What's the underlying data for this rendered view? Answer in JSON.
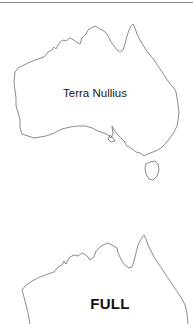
{
  "maps": [
    {
      "region": "Australia",
      "label": "Terra Nullius",
      "outline_color": "#6e6e6e"
    },
    {
      "region": "Australia",
      "label": "FULL",
      "outline_color": "#6e6e6e"
    }
  ],
  "colors": {
    "background": "#ffffff",
    "rule": "#8a8a8a",
    "label_text": "#1a1a1a"
  }
}
